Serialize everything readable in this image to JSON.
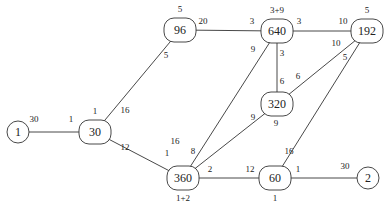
{
  "diagram": {
    "type": "weighted-graph",
    "nodes": [
      {
        "id": "n1",
        "label": "1",
        "shape": "circle",
        "x": 18,
        "y": 132,
        "r": 11
      },
      {
        "id": "n30",
        "label": "30",
        "shape": "rounded",
        "x": 95,
        "y": 132,
        "w": 32,
        "h": 24,
        "top": "1"
      },
      {
        "id": "n96",
        "label": "96",
        "shape": "rounded",
        "x": 180,
        "y": 30,
        "w": 32,
        "h": 24,
        "top": "5"
      },
      {
        "id": "n640",
        "label": "640",
        "shape": "rounded",
        "x": 277,
        "y": 31,
        "w": 32,
        "h": 24,
        "top": "3+9"
      },
      {
        "id": "n192",
        "label": "192",
        "shape": "rounded",
        "x": 367,
        "y": 31,
        "w": 32,
        "h": 24,
        "top": "5"
      },
      {
        "id": "n320",
        "label": "320",
        "shape": "rounded",
        "x": 277,
        "y": 104,
        "w": 32,
        "h": 24
      },
      {
        "id": "n360",
        "label": "360",
        "shape": "rounded",
        "x": 183,
        "y": 178,
        "w": 32,
        "h": 24,
        "bottom": "1+2"
      },
      {
        "id": "n60",
        "label": "60",
        "shape": "rounded",
        "x": 275,
        "y": 178,
        "w": 32,
        "h": 24,
        "bottom": "1"
      },
      {
        "id": "n2",
        "label": "2",
        "shape": "circle",
        "x": 368,
        "y": 178,
        "r": 11
      }
    ],
    "edges": [
      {
        "from": "n1",
        "to": "n30",
        "w1": "30",
        "w2": "1",
        "l1": [
          34,
          122
        ],
        "l2": [
          71,
          122
        ]
      },
      {
        "from": "n30",
        "to": "n96",
        "w1": "16",
        "w2": "5",
        "l1": [
          125,
          113
        ],
        "l2": [
          166,
          58
        ]
      },
      {
        "from": "n30",
        "to": "n360",
        "w1": "12",
        "w2": "1",
        "l1": [
          125,
          150
        ],
        "l2": [
          167,
          156
        ]
      },
      {
        "from": "n96",
        "to": "n640",
        "w1": "20",
        "w2": "3",
        "l1": [
          203,
          24
        ],
        "l2": [
          252,
          24
        ]
      },
      {
        "from": "n640",
        "to": "n192",
        "w1": "3",
        "w2": "10",
        "l1": [
          299,
          24
        ],
        "l2": [
          343,
          24
        ]
      },
      {
        "from": "n640",
        "to": "n320",
        "w1": "3",
        "w2": "6",
        "l1": [
          282,
          56
        ],
        "l2": [
          282,
          84
        ]
      },
      {
        "from": "n640",
        "to": "n360",
        "w1": "9",
        "w2": "16",
        "l1": [
          253,
          52
        ],
        "l2": [
          175,
          144
        ]
      },
      {
        "from": "n192",
        "to": "n320",
        "w1": "10",
        "w2": "6",
        "l1": [
          336,
          46
        ],
        "l2": [
          298,
          79
        ]
      },
      {
        "from": "n192",
        "to": "n60",
        "w1": "5",
        "w2": "16",
        "l1": [
          345,
          60
        ],
        "l2": [
          289,
          154
        ]
      },
      {
        "from": "n320",
        "to": "n360",
        "w1": "9",
        "w2": "8",
        "l1": [
          253,
          120
        ],
        "l2": [
          193,
          154
        ]
      },
      {
        "from": "n320",
        "to": "n360",
        "w1": "",
        "w2": "",
        "extra": "9",
        "l1": [
          276,
          126
        ],
        "l2": [
          0,
          0
        ]
      },
      {
        "from": "n360",
        "to": "n60",
        "w1": "2",
        "w2": "12",
        "l1": [
          210,
          172
        ],
        "l2": [
          250,
          172
        ]
      },
      {
        "from": "n60",
        "to": "n2",
        "w1": "1",
        "w2": "30",
        "l1": [
          298,
          172
        ],
        "l2": [
          345,
          169
        ]
      }
    ]
  }
}
